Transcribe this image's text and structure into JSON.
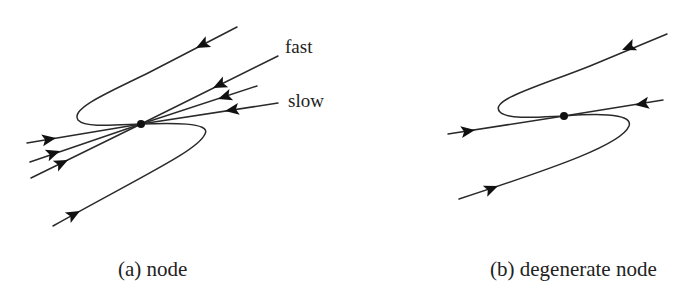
{
  "figure": {
    "panels": [
      {
        "id": "a",
        "caption": "(a) node",
        "center": {
          "x": 141,
          "y": 124
        },
        "line_labels": {
          "fast": "fast",
          "slow": "slow"
        }
      },
      {
        "id": "b",
        "caption": "(b) degenerate node",
        "center": {
          "x": 564,
          "y": 116
        }
      }
    ],
    "colors": {
      "stroke": "#2a2a2a",
      "arrow": "#111111",
      "background": "#ffffff"
    }
  }
}
